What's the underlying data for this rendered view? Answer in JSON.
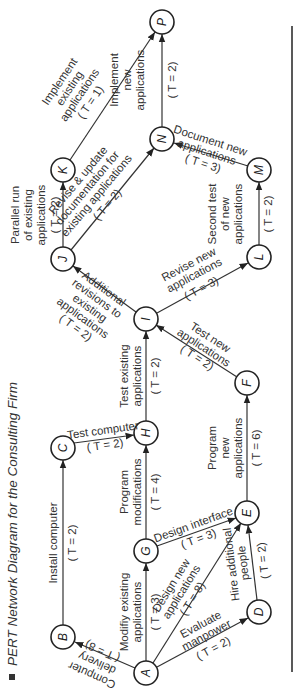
{
  "caption": {
    "title": "PERT Network Diagram for the Consulting Firm"
  },
  "colors": {
    "ink": "#222222",
    "edge": "#333333",
    "rule": "#222222"
  },
  "nodes": {
    "A": "A",
    "B": "B",
    "C": "C",
    "D": "D",
    "E": "E",
    "F": "F",
    "G": "G",
    "H": "H",
    "I": "I",
    "J": "J",
    "K": "K",
    "L": "L",
    "M": "M",
    "N": "N",
    "P": "P"
  },
  "activities": {
    "AB": {
      "from": "A",
      "to": "B",
      "lines": [
        "Computer",
        "delivery"
      ],
      "t": "( T = 8)"
    },
    "BC": {
      "from": "B",
      "to": "C",
      "lines": [
        "Install computer"
      ],
      "t": "( T = 2)"
    },
    "CH": {
      "from": "C",
      "to": "H",
      "lines": [
        "Test computer"
      ],
      "t": "( T = 2)"
    },
    "AG": {
      "from": "A",
      "to": "G",
      "lines": [
        "Modifiy existing",
        "applications"
      ],
      "t": "( T = 3)"
    },
    "GH": {
      "from": "G",
      "to": "H",
      "lines": [
        "Program",
        "modifications"
      ],
      "t": "( T = 4)"
    },
    "HI": {
      "from": "H",
      "to": "I",
      "lines": [
        "Test existing",
        "applications"
      ],
      "t": "( T = 2)"
    },
    "GE": {
      "from": "G",
      "to": "E",
      "lines": [
        "Design interface"
      ],
      "t": "( T = 3)"
    },
    "AE": {
      "from": "A",
      "to": "E",
      "lines": [
        "Design new",
        "applications"
      ],
      "t": "( T = 8)"
    },
    "AD": {
      "from": "A",
      "to": "D",
      "lines": [
        "Evaluate",
        "manpower"
      ],
      "t": "( T = 2)"
    },
    "DE": {
      "from": "D",
      "to": "E",
      "lines": [
        "Hire additional",
        "people"
      ],
      "t": "( T = 2)"
    },
    "EF": {
      "from": "E",
      "to": "F",
      "lines": [
        "Program",
        "new",
        "applications"
      ],
      "t": "( T = 6)"
    },
    "FI": {
      "from": "F",
      "to": "I",
      "lines": [
        "Test new",
        "applications"
      ],
      "t": "( T = 2)"
    },
    "IJ": {
      "from": "I",
      "to": "J",
      "lines": [
        "Additional",
        "revisions to",
        "existing",
        "applications"
      ],
      "t": "( T = 2)"
    },
    "IL": {
      "from": "I",
      "to": "L",
      "lines": [
        "Revise new",
        "applications"
      ],
      "t": "( T = 3)"
    },
    "JK": {
      "from": "J",
      "to": "K",
      "lines": [
        "Parallel run",
        "of existing",
        "applications"
      ],
      "t": "( T = 2)"
    },
    "JN": {
      "from": "J",
      "to": "N",
      "lines": [
        "Revise & update",
        "documentation for",
        "existing applications"
      ],
      "t": "( T = 2)"
    },
    "KP": {
      "from": "K",
      "to": "P",
      "lines": [
        "Implement",
        "existing",
        "applications"
      ],
      "t": "( T = 1)"
    },
    "LM": {
      "from": "L",
      "to": "M",
      "lines": [
        "Second test",
        "of new",
        "applications"
      ],
      "t": "( T = 2)"
    },
    "MN": {
      "from": "M",
      "to": "N",
      "lines": [
        "Document new",
        "applications"
      ],
      "t": "( T = 3)"
    },
    "NP": {
      "from": "N",
      "to": "P",
      "lines": [
        "Implement",
        "new",
        "applications"
      ],
      "t": "( T = 2)"
    }
  }
}
